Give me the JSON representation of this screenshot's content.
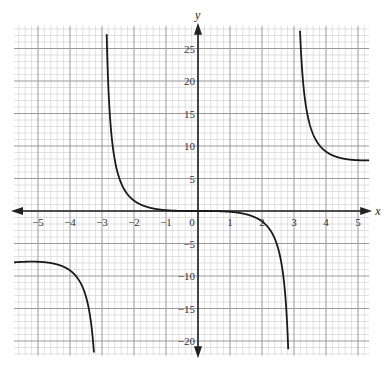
{
  "chart_data": {
    "type": "line",
    "title": "",
    "xlabel": "x",
    "ylabel": "y",
    "xlim": [
      -5.75,
      5.35
    ],
    "ylim": [
      -22.2,
      28.5
    ],
    "x_ticks": [
      -5,
      -4,
      -3,
      -2,
      -1,
      0,
      1,
      2,
      3,
      4,
      5
    ],
    "x_tick_labels": [
      "−5",
      "−4",
      "−3",
      "−2",
      "−1",
      "0",
      "1",
      "2",
      "3",
      "4",
      "5"
    ],
    "y_ticks": [
      -20,
      -15,
      -10,
      -5,
      5,
      10,
      15,
      20,
      25
    ],
    "y_tick_labels": [
      "−20",
      "−15",
      "−10",
      "−5",
      "5",
      "10",
      "15",
      "20",
      "25"
    ],
    "grid": true,
    "grid_minor_x_step": 0.2,
    "grid_minor_y_step": 1,
    "grid_major_x_step": 1,
    "grid_major_y_step": 5,
    "vertical_asymptotes": [
      -3,
      3
    ],
    "series": [
      {
        "name": "y = x^3/(x^2 - 9)",
        "branches": [
          {
            "x": [
              -5.75,
              -5.5,
              -5.2,
              -5.0,
              -4.5,
              -4.0,
              -3.7,
              -3.5,
              -3.35,
              -3.25
            ],
            "y": [
              -7.9,
              -7.83,
              -7.79,
              -7.81,
              -8.1,
              -9.14,
              -10.5,
              -13.2,
              -16.3,
              -21.8
            ]
          },
          {
            "x": [
              -2.82,
              -2.75,
              -2.6,
              -2.4,
              -2.2,
              -2.0,
              -1.5,
              -1.0,
              -0.5,
              0.0
            ],
            "y": [
              21.8,
              17.3,
              7.8,
              4.1,
              2.4,
              1.6,
              0.5,
              0.12,
              0.01,
              0.0
            ]
          },
          {
            "x": [
              0.0,
              0.5,
              1.0,
              1.5,
              2.0,
              2.2,
              2.4,
              2.6,
              2.75,
              2.82
            ],
            "y": [
              0.0,
              -0.01,
              -0.12,
              -0.5,
              -1.6,
              -2.4,
              -4.1,
              -7.8,
              -17.3,
              -21.8
            ]
          },
          {
            "x": [
              3.22,
              3.25,
              3.35,
              3.5,
              3.7,
              4.0,
              4.5,
              5.0,
              5.2,
              5.35
            ],
            "y": [
              28.0,
              21.8,
              16.3,
              13.2,
              10.5,
              9.14,
              8.1,
              7.81,
              7.79,
              7.8
            ]
          }
        ]
      }
    ]
  }
}
